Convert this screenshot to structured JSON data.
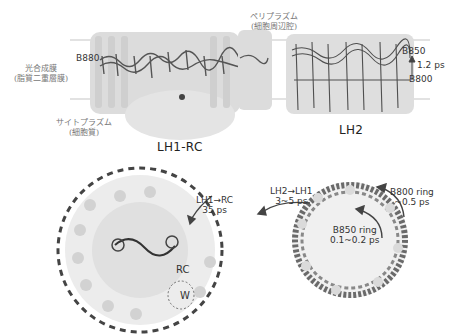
{
  "membrane": {
    "periplasm_label": "ペリプラズム",
    "periplasm_sub": "(細胞周辺腔)",
    "membrane_label": "光合成膜",
    "membrane_sub": "(脂質二重層膜)",
    "cytoplasm_label": "サイトプラズム",
    "cytoplasm_sub": "(細胞質)"
  },
  "side_view": {
    "lh1rc": {
      "title": "LH1-RC",
      "b880_label": "B880"
    },
    "lh2": {
      "title": "LH2",
      "b850_label": "B850",
      "b800_label": "B800",
      "transfer_time": "1.2 ps"
    }
  },
  "top_view": {
    "lh1_to_rc_label": "LH1→RC",
    "lh1_to_rc_time": "35 ps",
    "lh2_to_lh1_label": "LH2→LH1",
    "lh2_to_lh1_time": "3~5 ps",
    "b850_ring_label": "B850 ring",
    "b850_ring_time": "0.1~0.2 ps",
    "b800_ring_label": "B800 ring",
    "b800_ring_time": "~0.5 ps",
    "rc_label": "RC",
    "w_label": "W"
  },
  "colors": {
    "protein": "#d6d6d6",
    "pigment": "#4a4a4a",
    "membrane_line": "#cfcfcf",
    "text": "#333333"
  }
}
